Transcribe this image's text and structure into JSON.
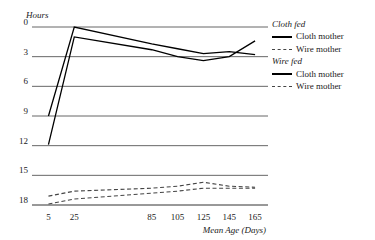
{
  "chart_data": {
    "type": "line",
    "title": "",
    "xlabel": "Mean Age (Days)",
    "ylabel": "Hours",
    "xlim": [
      0,
      175
    ],
    "ylim": [
      0,
      18
    ],
    "xticks": [
      5,
      25,
      85,
      105,
      125,
      145,
      165
    ],
    "yticks": [
      0,
      3,
      6,
      9,
      12,
      15,
      18
    ],
    "grid": true,
    "legend_position": "right",
    "x": [
      5,
      25,
      85,
      105,
      125,
      145,
      165
    ],
    "series": [
      {
        "name": "Cloth fed — Cloth mother",
        "group": "Cloth fed",
        "label": "Cloth mother",
        "style": "solid",
        "color": "#000000",
        "values": [
          9.0,
          18.0,
          16.3,
          15.8,
          15.3,
          15.5,
          15.2
        ]
      },
      {
        "name": "Cloth fed — Wire mother",
        "group": "Cloth fed",
        "label": "Wire mother",
        "style": "dashed",
        "color": "#444444",
        "values": [
          0.9,
          1.4,
          1.7,
          1.9,
          2.3,
          1.9,
          1.8
        ]
      },
      {
        "name": "Wire fed — Cloth mother",
        "group": "Wire fed",
        "label": "Cloth mother",
        "style": "solid",
        "color": "#000000",
        "values": [
          6.1,
          17.0,
          15.7,
          15.0,
          14.6,
          15.0,
          16.6
        ]
      },
      {
        "name": "Wire fed — Wire mother",
        "group": "Wire fed",
        "label": "Wire mother",
        "style": "dashed",
        "color": "#444444",
        "values": [
          0.1,
          0.6,
          1.2,
          1.4,
          1.7,
          1.7,
          1.7
        ]
      }
    ]
  },
  "axes": {
    "y_title": "Hours",
    "x_title": "Mean Age (Days)",
    "y_tick_labels": [
      "18",
      "15",
      "12",
      "9",
      "6",
      "3",
      "0"
    ],
    "x_tick_labels": [
      "5",
      "25",
      "85",
      "105",
      "125",
      "145",
      "165"
    ]
  },
  "legend": {
    "groups": [
      {
        "title": "Cloth fed",
        "entries": [
          {
            "label": "Cloth mother",
            "style": "solid"
          },
          {
            "label": "Wire mother",
            "style": "dashed"
          }
        ]
      },
      {
        "title": "Wire fed",
        "entries": [
          {
            "label": "Cloth mother",
            "style": "solid"
          },
          {
            "label": "Wire mother",
            "style": "dashed"
          }
        ]
      }
    ]
  }
}
